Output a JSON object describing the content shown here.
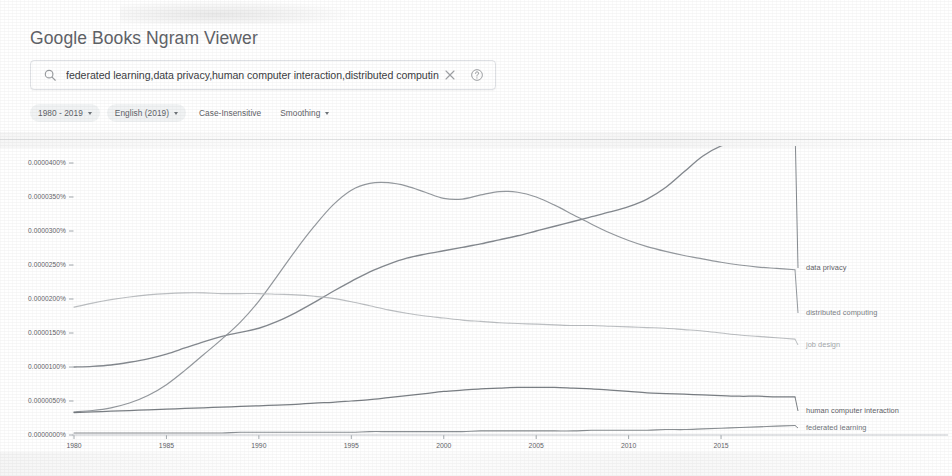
{
  "app": {
    "title": "Google Books Ngram Viewer"
  },
  "search": {
    "icon": "search-icon",
    "value": "federated learning,data privacy,human computer interaction,distributed computing",
    "value_displayed": "federated learning,data privacy,human computer interaction,distributed computin",
    "placeholder": "Search in Google Books Ngram Viewer",
    "clear_icon": "close-icon",
    "help_icon": "help-icon"
  },
  "filters": [
    {
      "label": "1980 - 2019",
      "has_caret": true,
      "filled": true,
      "name": "date-range-filter"
    },
    {
      "label": "English (2019)",
      "has_caret": true,
      "filled": true,
      "name": "corpus-filter"
    },
    {
      "label": "Case-Insensitive",
      "has_caret": false,
      "filled": false,
      "name": "case-insensitive-filter"
    },
    {
      "label": "Smoothing",
      "has_caret": true,
      "filled": false,
      "name": "smoothing-filter"
    }
  ],
  "chart_data": {
    "type": "line",
    "title": "",
    "xlabel": "",
    "ylabel": "",
    "xlim": [
      1980,
      2019
    ],
    "ylim": [
      0.0,
      4e-05
    ],
    "grid": false,
    "legend_position": "right-inline",
    "x_ticks": [
      1980,
      1985,
      1990,
      1995,
      2000,
      2005,
      2010,
      2015
    ],
    "y_ticks": [
      0.0,
      5e-06,
      1e-05,
      1.5e-05,
      2e-05,
      2.5e-05,
      3e-05,
      3.5e-05,
      4e-05
    ],
    "y_tick_labels": [
      "0.0000000%",
      "0.0000050%",
      "0.0000100%",
      "0.0000150%",
      "0.0000200%",
      "0.0000250%",
      "0.0000300%",
      "0.0000350%",
      "0.0000400%"
    ],
    "x": [
      1980,
      1981,
      1982,
      1983,
      1984,
      1985,
      1986,
      1987,
      1988,
      1989,
      1990,
      1991,
      1992,
      1993,
      1994,
      1995,
      1996,
      1997,
      1998,
      1999,
      2000,
      2001,
      2002,
      2003,
      2004,
      2005,
      2006,
      2007,
      2008,
      2009,
      2010,
      2011,
      2012,
      2013,
      2014,
      2015,
      2016,
      2017,
      2018,
      2019
    ],
    "series": [
      {
        "name": "data privacy",
        "color": "#7a7f85",
        "label_color": "#5f6368",
        "width": 1.35,
        "values": [
          1e-05,
          1.01e-05,
          1.03e-05,
          1.07e-05,
          1.12e-05,
          1.19e-05,
          1.28e-05,
          1.37e-05,
          1.45e-05,
          1.51e-05,
          1.57e-05,
          1.67e-05,
          1.8e-05,
          1.95e-05,
          2.11e-05,
          2.26e-05,
          2.4e-05,
          2.51e-05,
          2.6e-05,
          2.66e-05,
          2.71e-05,
          2.76e-05,
          2.81e-05,
          2.87e-05,
          2.93e-05,
          3e-05,
          3.07e-05,
          3.14e-05,
          3.21e-05,
          3.28e-05,
          3.36e-05,
          3.47e-05,
          3.64e-05,
          3.87e-05,
          4.1e-05,
          4.25e-05,
          4.33e-05,
          4.4e-05,
          4.48e-05,
          4.55e-05
        ]
      },
      {
        "name": "distributed computing",
        "color": "#8b9096",
        "label_color": "#7b8084",
        "width": 1.2,
        "values": [
          3.4e-06,
          3.6e-06,
          4e-06,
          4.7e-06,
          5.8e-06,
          7.4e-06,
          9.5e-06,
          1.18e-05,
          1.41e-05,
          1.66e-05,
          1.97e-05,
          2.34e-05,
          2.72e-05,
          3.07e-05,
          3.38e-05,
          3.6e-05,
          3.7e-05,
          3.71e-05,
          3.66e-05,
          3.57e-05,
          3.48e-05,
          3.47e-05,
          3.53e-05,
          3.58e-05,
          3.57e-05,
          3.5e-05,
          3.38e-05,
          3.24e-05,
          3.1e-05,
          2.97e-05,
          2.86e-05,
          2.77e-05,
          2.7e-05,
          2.64e-05,
          2.59e-05,
          2.54e-05,
          2.5e-05,
          2.47e-05,
          2.45e-05,
          2.43e-05
        ]
      },
      {
        "name": "job design",
        "color": "#b6babd",
        "label_color": "#a6aaad",
        "width": 1.15,
        "values": [
          1.88e-05,
          1.94e-05,
          1.99e-05,
          2.03e-05,
          2.06e-05,
          2.08e-05,
          2.09e-05,
          2.09e-05,
          2.08e-05,
          2.08e-05,
          2.08e-05,
          2.07e-05,
          2.06e-05,
          2.04e-05,
          2.01e-05,
          1.96e-05,
          1.9e-05,
          1.84e-05,
          1.79e-05,
          1.75e-05,
          1.72e-05,
          1.69e-05,
          1.67e-05,
          1.65e-05,
          1.64e-05,
          1.63e-05,
          1.62e-05,
          1.61e-05,
          1.61e-05,
          1.6e-05,
          1.59e-05,
          1.58e-05,
          1.57e-05,
          1.55e-05,
          1.53e-05,
          1.5e-05,
          1.47e-05,
          1.45e-05,
          1.43e-05,
          1.41e-05
        ]
      },
      {
        "name": "human computer interaction",
        "color": "#6f7479",
        "label_color": "#5f6368",
        "width": 1.25,
        "values": [
          3.3e-06,
          3.4e-06,
          3.5e-06,
          3.6e-06,
          3.7e-06,
          3.8e-06,
          3.9e-06,
          4e-06,
          4.1e-06,
          4.2e-06,
          4.3e-06,
          4.4e-06,
          4.5e-06,
          4.7e-06,
          4.8e-06,
          5e-06,
          5.2e-06,
          5.5e-06,
          5.8e-06,
          6.1e-06,
          6.4e-06,
          6.6e-06,
          6.8e-06,
          6.9e-06,
          7e-06,
          7e-06,
          7e-06,
          6.9e-06,
          6.8e-06,
          6.6e-06,
          6.4e-06,
          6.2e-06,
          6.1e-06,
          6e-06,
          5.9e-06,
          5.8e-06,
          5.7e-06,
          5.7e-06,
          5.6e-06,
          5.6e-06
        ]
      },
      {
        "name": "federated learning",
        "color": "#80858a",
        "label_color": "#6f7479",
        "width": 1.1,
        "values": [
          3e-07,
          3e-07,
          3e-07,
          3e-07,
          3e-07,
          3e-07,
          3e-07,
          3e-07,
          3e-07,
          4e-07,
          4e-07,
          4e-07,
          4e-07,
          4e-07,
          4e-07,
          4e-07,
          5e-07,
          5e-07,
          5e-07,
          5e-07,
          5e-07,
          5e-07,
          6e-07,
          6e-07,
          6e-07,
          6e-07,
          6e-07,
          6e-07,
          7e-07,
          7e-07,
          7e-07,
          7e-07,
          8e-07,
          8e-07,
          9e-07,
          1e-06,
          1.1e-06,
          1.2e-06,
          1.3e-06,
          1.4e-06
        ]
      }
    ],
    "label_anchors": [
      {
        "name": "data privacy",
        "y_px": 268
      },
      {
        "name": "distributed computing",
        "y_px": 313
      },
      {
        "name": "job design",
        "y_px": 345
      },
      {
        "name": "human computer interaction",
        "y_px": 411
      },
      {
        "name": "federated learning",
        "y_px": 428
      }
    ]
  }
}
